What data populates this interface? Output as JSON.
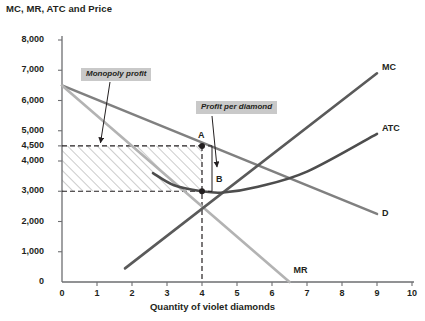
{
  "chart_data": {
    "type": "line",
    "title": "MC, MR, ATC and Price",
    "xlabel": "Quantity of violet diamonds",
    "ylabel": "MC, MR, ATC and Price",
    "xlim": [
      0,
      10
    ],
    "ylim": [
      0,
      8000
    ],
    "grid": false,
    "legend": "inline-end-labels",
    "xticks": [
      "0",
      "1",
      "2",
      "3",
      "4",
      "5",
      "6",
      "7",
      "8",
      "9",
      "10"
    ],
    "xtick_values": [
      0,
      1,
      2,
      3,
      4,
      5,
      6,
      7,
      8,
      9,
      10
    ],
    "yticks": [
      "0",
      "1,000",
      "2,000",
      "3,000",
      "4,000",
      "4,500",
      "5,000",
      "6,000",
      "7,000",
      "8,000"
    ],
    "ytick_values": [
      0,
      1000,
      2000,
      3000,
      4000,
      4500,
      5000,
      6000,
      7000,
      8000
    ],
    "series": [
      {
        "name": "D",
        "label": "D",
        "color": "#808080",
        "type": "line",
        "points": [
          [
            0,
            6500
          ],
          [
            9,
            2250
          ]
        ]
      },
      {
        "name": "MR",
        "label": "MR",
        "color": "#b3b3b3",
        "type": "line",
        "points": [
          [
            0,
            6500
          ],
          [
            6.5,
            0
          ]
        ]
      },
      {
        "name": "MC",
        "label": "MC",
        "color": "#5a5a5a",
        "type": "line",
        "points": [
          [
            1.8,
            450
          ],
          [
            9,
            6900
          ]
        ]
      },
      {
        "name": "ATC",
        "label": "ATC",
        "color": "#4d4d4d",
        "type": "curve",
        "points": [
          [
            2.6,
            3600
          ],
          [
            3.2,
            3200
          ],
          [
            4.0,
            3000
          ],
          [
            4.6,
            2960
          ],
          [
            5.6,
            3150
          ],
          [
            7.0,
            3650
          ],
          [
            9.0,
            4900
          ]
        ]
      }
    ],
    "annotations": [
      {
        "name": "monopoly-profit",
        "text": "Monopoly profit",
        "target_x": 1.1,
        "target_y": 4500
      },
      {
        "name": "profit-per-diamond",
        "text": "Profit per diamond",
        "target_x": 4.05,
        "target_y": 3800
      }
    ],
    "markers": [
      {
        "name": "point-a",
        "label": "A",
        "x": 4,
        "y": 4500
      },
      {
        "name": "point-b",
        "label": "B",
        "x": 4,
        "y": 3000
      }
    ],
    "shaded_region": {
      "name": "monopoly-profit-area",
      "description": "hatched rectangle of monopoly profit",
      "x_range": [
        0,
        4
      ],
      "y_range": [
        3000,
        4500
      ],
      "fill": "diagonal-hatch",
      "hatch_color": "#9a9a9a"
    },
    "reference_lines": [
      {
        "name": "price-line",
        "orientation": "horizontal",
        "value": 4500,
        "style": "dashed"
      },
      {
        "name": "cost-line",
        "orientation": "horizontal",
        "value": 3000,
        "style": "dashed"
      },
      {
        "name": "quantity-line",
        "orientation": "vertical",
        "value": 4,
        "style": "dashed"
      }
    ]
  }
}
